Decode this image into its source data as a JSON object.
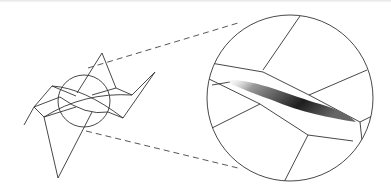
{
  "figure": {
    "overview": {
      "circle": {
        "cx": 84,
        "cy": 101,
        "r": 26
      }
    },
    "magnified": {
      "circle": {
        "cx": 290,
        "cy": 98,
        "r": 83
      },
      "shade_color": "#222222"
    },
    "connector_style": "dashed",
    "line_color": "#333333"
  }
}
